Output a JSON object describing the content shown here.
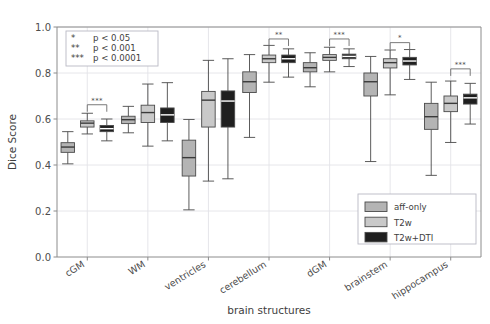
{
  "chart_data": {
    "type": "box",
    "title": "",
    "xlabel": "brain structures",
    "ylabel": "Dice Score",
    "ylim": [
      0.0,
      1.0
    ],
    "yticks": [
      "0.0",
      "0.2",
      "0.4",
      "0.6",
      "0.8",
      "1.0"
    ],
    "ytick_values": [
      0.0,
      0.2,
      0.4,
      0.6,
      0.8,
      1.0
    ],
    "grid": true,
    "legend_position": "lower right",
    "categories": [
      "cGM",
      "WM",
      "ventricles",
      "cerebellum",
      "dGM",
      "brainstem",
      "hippocampus"
    ],
    "series": [
      {
        "name": "aff-only",
        "color": "#b4b4b4",
        "boxes": [
          {
            "category": "cGM",
            "whisker_low": 0.405,
            "q1": 0.455,
            "median": 0.478,
            "q3": 0.497,
            "whisker_high": 0.545
          },
          {
            "category": "WM",
            "whisker_low": 0.54,
            "q1": 0.58,
            "median": 0.597,
            "q3": 0.612,
            "whisker_high": 0.655
          },
          {
            "category": "ventricles",
            "whisker_low": 0.205,
            "q1": 0.352,
            "median": 0.432,
            "q3": 0.508,
            "whisker_high": 0.598
          },
          {
            "category": "cerebellum",
            "whisker_low": 0.52,
            "q1": 0.715,
            "median": 0.762,
            "q3": 0.805,
            "whisker_high": 0.88
          },
          {
            "category": "dGM",
            "whisker_low": 0.74,
            "q1": 0.805,
            "median": 0.823,
            "q3": 0.845,
            "whisker_high": 0.888
          },
          {
            "category": "brainstem",
            "whisker_low": 0.415,
            "q1": 0.7,
            "median": 0.762,
            "q3": 0.8,
            "whisker_high": 0.872
          },
          {
            "category": "hippocampus",
            "whisker_low": 0.355,
            "q1": 0.555,
            "median": 0.61,
            "q3": 0.668,
            "whisker_high": 0.76
          }
        ]
      },
      {
        "name": "T2w",
        "color": "#c9c9c9",
        "boxes": [
          {
            "category": "cGM",
            "whisker_low": 0.535,
            "q1": 0.565,
            "median": 0.582,
            "q3": 0.592,
            "whisker_high": 0.625
          },
          {
            "category": "WM",
            "whisker_low": 0.482,
            "q1": 0.585,
            "median": 0.628,
            "q3": 0.66,
            "whisker_high": 0.752
          },
          {
            "category": "ventricles",
            "whisker_low": 0.33,
            "q1": 0.565,
            "median": 0.682,
            "q3": 0.72,
            "whisker_high": 0.855
          },
          {
            "category": "cerebellum",
            "whisker_low": 0.76,
            "q1": 0.845,
            "median": 0.862,
            "q3": 0.878,
            "whisker_high": 0.92
          },
          {
            "category": "dGM",
            "whisker_low": 0.805,
            "q1": 0.855,
            "median": 0.868,
            "q3": 0.88,
            "whisker_high": 0.912
          },
          {
            "category": "brainstem",
            "whisker_low": 0.705,
            "q1": 0.822,
            "median": 0.845,
            "q3": 0.862,
            "whisker_high": 0.9
          },
          {
            "category": "hippocampus",
            "whisker_low": 0.498,
            "q1": 0.632,
            "median": 0.668,
            "q3": 0.7,
            "whisker_high": 0.765
          }
        ]
      },
      {
        "name": "T2w+DTI",
        "color": "#1f1f1f",
        "boxes": [
          {
            "category": "cGM",
            "whisker_low": 0.505,
            "q1": 0.545,
            "median": 0.558,
            "q3": 0.572,
            "whisker_high": 0.6
          },
          {
            "category": "WM",
            "whisker_low": 0.505,
            "q1": 0.585,
            "median": 0.618,
            "q3": 0.648,
            "whisker_high": 0.758
          },
          {
            "category": "ventricles",
            "whisker_low": 0.34,
            "q1": 0.565,
            "median": 0.678,
            "q3": 0.722,
            "whisker_high": 0.862
          },
          {
            "category": "cerebellum",
            "whisker_low": 0.782,
            "q1": 0.845,
            "median": 0.862,
            "q3": 0.878,
            "whisker_high": 0.905
          },
          {
            "category": "dGM",
            "whisker_low": 0.828,
            "q1": 0.862,
            "median": 0.872,
            "q3": 0.882,
            "whisker_high": 0.905
          },
          {
            "category": "brainstem",
            "whisker_low": 0.772,
            "q1": 0.835,
            "median": 0.852,
            "q3": 0.868,
            "whisker_high": 0.902
          },
          {
            "category": "hippocampus",
            "whisker_low": 0.578,
            "q1": 0.665,
            "median": 0.692,
            "q3": 0.708,
            "whisker_high": 0.755
          }
        ]
      }
    ],
    "annotations": [
      {
        "category": "cGM",
        "label": "***",
        "from_series": "T2w",
        "to_series": "T2w+DTI",
        "y": 0.662
      },
      {
        "category": "cerebellum",
        "label": "**",
        "from_series": "T2w",
        "to_series": "T2w+DTI",
        "y": 0.948
      },
      {
        "category": "dGM",
        "label": "***",
        "from_series": "T2w",
        "to_series": "T2w+DTI",
        "y": 0.948
      },
      {
        "category": "brainstem",
        "label": "*",
        "from_series": "T2w",
        "to_series": "T2w+DTI",
        "y": 0.932
      },
      {
        "category": "hippocampus",
        "label": "***",
        "from_series": "T2w",
        "to_series": "T2w+DTI",
        "y": 0.818
      }
    ]
  },
  "pvalue_legend": {
    "rows": [
      {
        "marks": "*",
        "text": "p < 0.05"
      },
      {
        "marks": "**",
        "text": "p < 0.001"
      },
      {
        "marks": "***",
        "text": "p < 0.0001"
      }
    ]
  },
  "series_legend": {
    "entries": [
      {
        "label": "aff-only",
        "color": "#b4b4b4"
      },
      {
        "label": "T2w",
        "color": "#c9c9c9"
      },
      {
        "label": "T2w+DTI",
        "color": "#1f1f1f"
      }
    ]
  },
  "axes": {
    "ylabel": "Dice Score",
    "xlabel": "brain structures"
  }
}
